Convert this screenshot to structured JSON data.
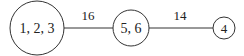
{
  "diagram": {
    "nodes": [
      {
        "id": "n1",
        "label": "1, 2, 3"
      },
      {
        "id": "n2",
        "label": "5, 6"
      },
      {
        "id": "n3",
        "label": "4"
      }
    ],
    "edges": [
      {
        "from": "n1",
        "to": "n2",
        "label": "16"
      },
      {
        "from": "n2",
        "to": "n3",
        "label": "14"
      }
    ],
    "colors": {
      "stroke": "#333333",
      "text": "#222222",
      "background": "#ffffff"
    }
  }
}
